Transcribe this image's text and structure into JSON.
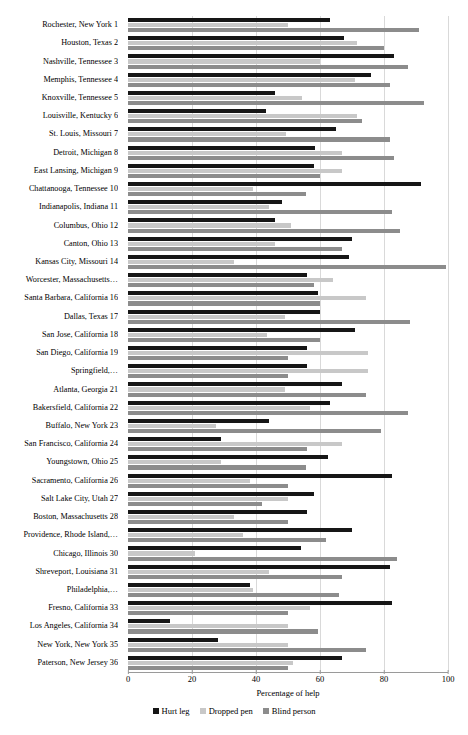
{
  "chart_data": {
    "type": "bar",
    "orientation": "horizontal",
    "title": "",
    "xlabel": "Percentage of help",
    "ylabel": "",
    "xlim": [
      0,
      100
    ],
    "xticks": [
      0,
      20,
      40,
      60,
      80,
      100
    ],
    "grid": true,
    "legend_position": "bottom",
    "categories": [
      "Rochester, New York 1",
      "Houston, Texas 2",
      "Nashville, Tennessee 3",
      "Memphis, Tennessee 4",
      "Knoxville, Tennessee 5",
      "Louisville, Kentucky 6",
      "St. Louis, Missouri 7",
      "Detroit, Michigan 8",
      "East Lansing, Michigan 9",
      "Chattanooga, Tennessee 10",
      "Indianapolis, Indiana 11",
      "Columbus, Ohio 12",
      "Canton, Ohio 13",
      "Kansas City, Missouri 14",
      "Worcester, Massachusetts…",
      "Santa Barbara, California 16",
      "Dallas, Texas 17",
      "San Jose, California 18",
      "San Diego, California 19",
      "Springfield,…",
      "Atlanta, Georgia 21",
      "Bakersfield, California 22",
      "Buffalo, New York 23",
      "San Francisco, California 24",
      "Youngstown, Ohio 25",
      "Sacramento, California 26",
      "Salt Lake City, Utah 27",
      "Boston, Massachusetts 28",
      "Providence, Rhode Island,…",
      "Chicago, Illinois 30",
      "Shreveport, Louisiana 31",
      "Philadelphia,…",
      "Fresno, California 33",
      "Los Angeles, California 34",
      "New York, New York 35",
      "Paterson, New Jersey 36"
    ],
    "series": [
      {
        "name": "Hurt leg",
        "color": "#161616",
        "values": [
          63,
          67.5,
          83,
          76,
          46,
          43,
          65,
          58.5,
          58,
          91.5,
          48,
          46,
          70,
          69,
          56,
          59.5,
          60,
          71,
          56,
          56,
          67,
          63,
          44,
          29,
          62.5,
          82.5,
          58,
          56,
          70,
          54,
          82,
          38,
          82.5,
          13,
          28,
          67
        ]
      },
      {
        "name": "Dropped pen",
        "color": "#c8c8c8",
        "values": [
          50,
          71.5,
          60,
          71,
          54.5,
          71.5,
          49.5,
          67,
          67,
          39,
          44,
          51,
          46,
          33,
          64,
          74.5,
          49,
          43.5,
          75,
          75,
          49,
          57,
          27.5,
          67,
          29,
          38,
          50,
          33,
          36,
          21,
          44,
          39,
          57,
          50,
          50,
          51.5
        ]
      },
      {
        "name": "Blind person",
        "color": "#8c8c8c",
        "values": [
          91,
          80,
          87.5,
          82,
          92.5,
          73,
          82,
          83,
          60,
          55.5,
          82.5,
          85,
          67,
          99.5,
          58,
          60,
          88,
          60,
          50,
          50,
          74.5,
          87.5,
          79,
          56,
          55.5,
          50,
          42,
          50,
          62,
          84,
          67,
          66,
          50,
          59.5,
          74.5,
          50
        ]
      }
    ]
  }
}
